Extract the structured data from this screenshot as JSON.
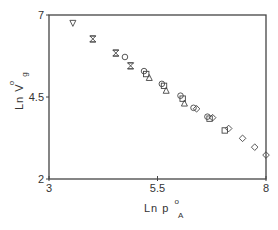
{
  "chart_data": {
    "type": "scatter",
    "title": "",
    "xlabel": "Ln p°A",
    "xlabel_parts": {
      "main": "Ln p",
      "sup": "o",
      "sub": "A"
    },
    "ylabel": "Ln V°g",
    "ylabel_parts": {
      "main": "Ln V",
      "sup": "o",
      "sub": "g"
    },
    "xlim": [
      3,
      8
    ],
    "ylim": [
      2,
      7
    ],
    "xticks": [
      3,
      5.5,
      8
    ],
    "xtick_labels": [
      "3",
      "5.5",
      "8"
    ],
    "yticks": [
      2,
      4.5,
      7
    ],
    "ytick_labels": [
      "2",
      "4.5",
      "7"
    ],
    "grid": false,
    "legend": null,
    "series": [
      {
        "name": "triangle-down",
        "marker": "triangle-down",
        "points": [
          [
            3.55,
            6.76
          ]
        ]
      },
      {
        "name": "hourglass",
        "marker": "hourglass",
        "points": [
          [
            4.01,
            6.27
          ],
          [
            4.54,
            5.84
          ],
          [
            4.88,
            5.45
          ]
        ]
      },
      {
        "name": "circle",
        "marker": "circle",
        "points": [
          [
            4.75,
            5.72
          ],
          [
            5.19,
            5.29
          ],
          [
            5.6,
            4.9
          ],
          [
            6.03,
            4.54
          ],
          [
            6.33,
            4.17
          ],
          [
            6.65,
            3.9
          ]
        ]
      },
      {
        "name": "square",
        "marker": "square",
        "points": [
          [
            5.24,
            5.2
          ],
          [
            5.65,
            4.84
          ],
          [
            6.08,
            4.45
          ],
          [
            6.7,
            3.84
          ],
          [
            7.05,
            3.48
          ]
        ]
      },
      {
        "name": "triangle-up",
        "marker": "triangle-up",
        "points": [
          [
            5.31,
            5.08
          ],
          [
            5.7,
            4.69
          ],
          [
            6.12,
            4.3
          ]
        ]
      },
      {
        "name": "diamond",
        "marker": "diamond",
        "points": [
          [
            6.4,
            4.14
          ],
          [
            6.77,
            3.87
          ],
          [
            7.14,
            3.54
          ],
          [
            7.46,
            3.24
          ],
          [
            7.74,
            2.97
          ],
          [
            8.0,
            2.73
          ]
        ]
      }
    ]
  }
}
